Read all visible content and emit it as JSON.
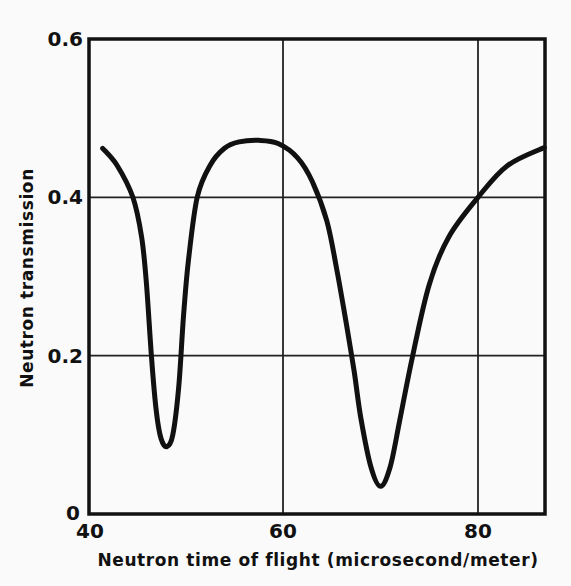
{
  "chart_data": {
    "type": "line",
    "title": "",
    "xlabel": "Neutron time of flight (microsecond/meter)",
    "ylabel": "Neutron transmission",
    "xlim": [
      40,
      87
    ],
    "ylim": [
      0,
      0.6
    ],
    "xticks": [
      40,
      60,
      80
    ],
    "xtick_labels": [
      "40",
      "60",
      "80"
    ],
    "yticks": [
      0,
      0.2,
      0.4,
      0.6
    ],
    "ytick_labels": [
      "0",
      "0.2",
      "0.4",
      "0.6"
    ],
    "grid": true,
    "legend": null,
    "series": [
      {
        "name": "Neutron transmission",
        "x": [
          41.5,
          43.0,
          44.6,
          45.5,
          46.0,
          46.5,
          47.0,
          47.5,
          48.1,
          48.7,
          49.3,
          49.8,
          50.3,
          51.2,
          52.5,
          54.0,
          55.5,
          57.5,
          59.5,
          61.5,
          63.0,
          64.5,
          65.5,
          66.5,
          67.3,
          68.0,
          69.0,
          70.0,
          71.0,
          72.0,
          73.3,
          75.0,
          77.0,
          80.0,
          83.0,
          86.8
        ],
        "y": [
          0.462,
          0.44,
          0.4,
          0.35,
          0.29,
          0.2,
          0.13,
          0.095,
          0.085,
          0.1,
          0.16,
          0.25,
          0.32,
          0.4,
          0.44,
          0.462,
          0.47,
          0.472,
          0.468,
          0.45,
          0.42,
          0.37,
          0.31,
          0.24,
          0.18,
          0.12,
          0.06,
          0.035,
          0.06,
          0.12,
          0.2,
          0.29,
          0.35,
          0.4,
          0.44,
          0.463
        ]
      }
    ],
    "annotations": [
      {
        "label": "first dip minimum",
        "x": 48.1,
        "y": 0.085
      },
      {
        "label": "peak",
        "x": 57.5,
        "y": 0.472
      },
      {
        "label": "second dip minimum",
        "x": 70.0,
        "y": 0.035
      }
    ]
  },
  "colors": {
    "line": "#111111",
    "grid": "#222222",
    "background": "#fafafa"
  }
}
